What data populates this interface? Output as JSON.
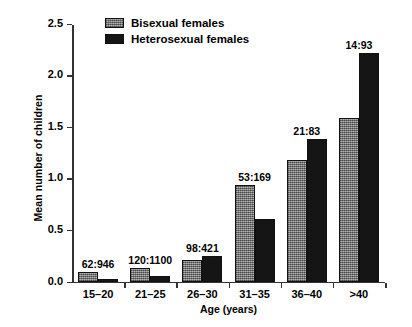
{
  "chart_data": {
    "type": "bar",
    "title": "",
    "xlabel": "Age (years)",
    "ylabel": "Mean number of children",
    "categories": [
      "15–20",
      "21–25",
      "26–30",
      "31–35",
      "36–40",
      ">40"
    ],
    "ylim": [
      0,
      2.5
    ],
    "yticks": [
      0.0,
      0.5,
      1.0,
      1.5,
      2.0,
      2.5
    ],
    "ytick_labels": [
      "0.0",
      "0.5",
      "1.0",
      "1.5",
      "2.0",
      "2.5"
    ],
    "grid": false,
    "legend_position": "top-center",
    "series": [
      {
        "name": "Bisexual females",
        "color": "#8a8a8a",
        "values": [
          0.09,
          0.13,
          0.21,
          0.94,
          1.18,
          1.58
        ]
      },
      {
        "name": "Heterosexual females",
        "color": "#151515",
        "values": [
          0.025,
          0.055,
          0.25,
          0.61,
          1.38,
          2.21
        ]
      }
    ],
    "annotations": [
      {
        "category": "15–20",
        "text": "62:946"
      },
      {
        "category": "21–25",
        "text": "120:1100"
      },
      {
        "category": "26–30",
        "text": "98:421"
      },
      {
        "category": "31–35",
        "text": "53:169"
      },
      {
        "category": "36–40",
        "text": "21:83"
      },
      {
        "category": ">40",
        "text": "14:93"
      }
    ]
  }
}
